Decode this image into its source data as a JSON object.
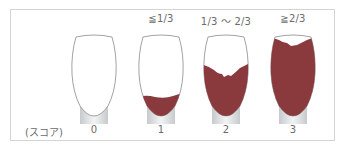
{
  "figure": {
    "score_caption": "(スコア)",
    "stain_color": "#8a3a3c",
    "outline_color": "#8a8a8a",
    "root_color": "#d9dcdf",
    "teeth": [
      {
        "score": "0",
        "range_label": "",
        "stain_level": "none"
      },
      {
        "score": "1",
        "range_label": "≦1/3",
        "stain_level": "up to one third"
      },
      {
        "score": "2",
        "range_label": "1/3 ～ 2/3",
        "stain_level": "one third to two thirds"
      },
      {
        "score": "3",
        "range_label": "≧2/3",
        "stain_level": "two thirds or more"
      }
    ]
  }
}
